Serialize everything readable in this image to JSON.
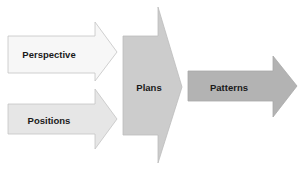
{
  "diagram": {
    "type": "flow-arrows",
    "nodes": [
      {
        "id": "perspective",
        "label": "Perspective",
        "fill": "#f7f7f7",
        "stroke": "#c4c4c4"
      },
      {
        "id": "positions",
        "label": "Positions",
        "fill": "#e6e6e6",
        "stroke": "#c4c4c4"
      },
      {
        "id": "plans",
        "label": "Plans",
        "fill": "#cccccc",
        "stroke": "#bdbdbd"
      },
      {
        "id": "patterns",
        "label": "Patterns",
        "fill": "#b3b3b3",
        "stroke": "#a8a8a8"
      }
    ],
    "edges": [
      {
        "from": "perspective",
        "to": "plans"
      },
      {
        "from": "positions",
        "to": "plans"
      },
      {
        "from": "plans",
        "to": "patterns"
      }
    ]
  }
}
